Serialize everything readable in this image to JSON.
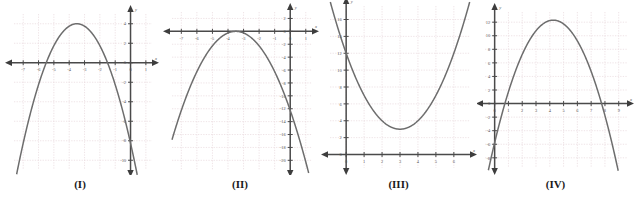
{
  "figure": {
    "background": "#ffffff",
    "curve_color": "#6d6d6d",
    "grid_color": "#e8d9dd",
    "axis_color": "#4a4a4a",
    "panel_count": 4
  },
  "captions": {
    "p1": "(I)",
    "p2": "(II)",
    "p3": "(III)",
    "p4": "(IV)"
  },
  "axis_names": {
    "x": "x",
    "y": "y"
  },
  "chart_data": [
    {
      "type": "line",
      "title": "(I)",
      "xlabel": "x",
      "ylabel": "y",
      "xlim": [
        -7.6,
        1.4
      ],
      "ylim": [
        -11.0,
        5.0
      ],
      "grid": true,
      "xticks": [
        -7,
        -6,
        -5,
        -4,
        -3,
        -2,
        -1,
        0,
        1
      ],
      "yticks": [
        4,
        2,
        0,
        -2,
        -4,
        -6,
        -8,
        -10
      ],
      "xtick_labels": [
        "-7",
        "-6",
        "-5",
        "-4",
        "-3",
        "-2",
        "-1",
        "0",
        "1"
      ],
      "ytick_labels": [
        "4",
        "2",
        "0",
        "-2",
        "-4",
        "-6",
        "-8",
        "-10"
      ],
      "curve": {
        "shape": "parabola",
        "opens": "down",
        "vertex": [
          -3.5,
          4
        ],
        "a": -1,
        "roots": [
          -5.5,
          -1.5
        ],
        "equation": "y = -(x + 3.5)^2 + 4"
      }
    },
    {
      "type": "line",
      "title": "(II)",
      "xlabel": "x",
      "ylabel": "y",
      "xlim": [
        -7.6,
        1.4
      ],
      "ylim": [
        -21.5,
        3.0
      ],
      "grid": true,
      "xticks": [
        -7,
        -6,
        -5,
        -4,
        -3,
        -2,
        -1,
        0,
        1
      ],
      "yticks": [
        2,
        0,
        -2,
        -4,
        -6,
        -8,
        -10,
        -12,
        -14,
        -16,
        -18,
        -20
      ],
      "xtick_labels": [
        "-7",
        "-6",
        "-5",
        "-4",
        "-3",
        "-2",
        "-1",
        "0",
        "1"
      ],
      "ytick_labels": [
        "2",
        "0",
        "-2",
        "-4",
        "-6",
        "-8",
        "-10",
        "-12",
        "-14",
        "-16",
        "-18",
        "-20"
      ],
      "curve": {
        "shape": "parabola",
        "opens": "down",
        "vertex": [
          -3.5,
          0
        ],
        "a": -1,
        "roots": [
          -3.5,
          -3.5
        ],
        "equation": "y = -(x + 3.5)^2"
      }
    },
    {
      "type": "line",
      "title": "(III)",
      "xlabel": "x",
      "ylabel": "y",
      "xlim": [
        -0.9,
        6.9
      ],
      "ylim": [
        -1.6,
        17.6
      ],
      "grid": true,
      "xticks": [
        0,
        1,
        2,
        3,
        4,
        5,
        6
      ],
      "yticks": [
        0,
        2,
        4,
        6,
        8,
        10,
        12,
        14,
        16
      ],
      "xtick_labels": [
        "0",
        "1",
        "2",
        "3",
        "4",
        "5",
        "6"
      ],
      "ytick_labels": [
        "0",
        "2",
        "4",
        "6",
        "8",
        "10",
        "12",
        "14",
        "16"
      ],
      "curve": {
        "shape": "parabola",
        "opens": "up",
        "vertex": [
          3,
          3
        ],
        "a": 1,
        "roots": [],
        "equation": "y = (x - 3)^2 + 3"
      }
    },
    {
      "type": "line",
      "title": "(IV)",
      "xlabel": "x",
      "ylabel": "y",
      "xlim": [
        -0.7,
        9.6
      ],
      "ylim": [
        -9.5,
        13.5
      ],
      "grid": true,
      "xticks": [
        0,
        1,
        2,
        3,
        4,
        5,
        6,
        7,
        8,
        9
      ],
      "yticks": [
        12,
        10,
        8,
        6,
        4,
        2,
        0,
        -2,
        -4,
        -6,
        -8
      ],
      "xtick_labels": [
        "0",
        "1",
        "2",
        "3",
        "4",
        "5",
        "6",
        "7",
        "8",
        "9"
      ],
      "ytick_labels": [
        "12",
        "10",
        "8",
        "6",
        "4",
        "2",
        "0",
        "-2",
        "-4",
        "-6",
        "-8"
      ],
      "curve": {
        "shape": "parabola",
        "opens": "down",
        "vertex": [
          4.25,
          12.3
        ],
        "a": -1,
        "roots": [
          0.75,
          7.75
        ],
        "equation": "y = -(x - 4.25)^2 + 12.3"
      }
    }
  ]
}
